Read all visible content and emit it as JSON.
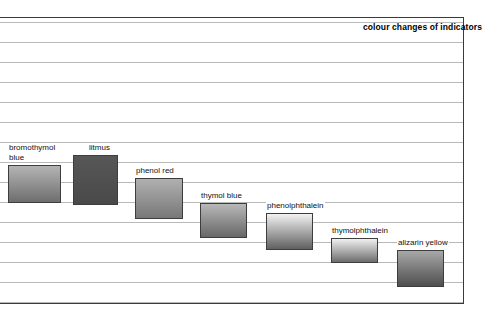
{
  "chart_data": {
    "type": "bar",
    "title": "colour changes of indicators",
    "xlabel": "",
    "ylabel": "",
    "orientation": "vertical-ranges",
    "grid": true,
    "legend_position": "none",
    "note": "Each indicator is drawn as a shaded vertical band spanning its colour-change pH range; bands step progressively downward and to the right.",
    "categories": [
      "bromothymol blue",
      "litmus",
      "phenol red",
      "thymol blue",
      "phenolphthalein",
      "thymolphthalein",
      "alizarin yellow"
    ],
    "bands": [
      {
        "name": "bromothymol blue",
        "label": "bromothymol\nblue",
        "x": 8,
        "y": 165,
        "width": 53,
        "height": 38,
        "label_x": 8,
        "label_y": 143,
        "gradient_top": "#b4b4b4",
        "gradient_bottom": "#6e6e6e"
      },
      {
        "name": "litmus",
        "label": "litmus",
        "x": 73,
        "y": 155,
        "width": 45,
        "height": 50,
        "label_x": 88,
        "label_y": 143,
        "gradient_top": "#575757",
        "gradient_bottom": "#494949"
      },
      {
        "name": "phenol red",
        "label": "phenol red",
        "x": 135,
        "y": 178,
        "width": 48,
        "height": 41,
        "label_x": 135,
        "label_y": 166,
        "gradient_top": "#b0b0b0",
        "gradient_bottom": "#787878"
      },
      {
        "name": "thymol blue",
        "label": "thymol blue",
        "x": 200,
        "y": 203,
        "width": 47,
        "height": 35,
        "label_x": 200,
        "label_y": 191,
        "gradient_top": "#b8b8b8",
        "gradient_bottom": "#676767"
      },
      {
        "name": "phenolphthalein",
        "label": "phenolphthalein",
        "x": 266,
        "y": 213,
        "width": 47,
        "height": 37,
        "label_x": 266,
        "label_y": 201,
        "gradient_top": "#f2f2f2",
        "gradient_bottom": "#606060"
      },
      {
        "name": "thymolphthalein",
        "label": "thymolphthalein",
        "x": 331,
        "y": 238,
        "width": 47,
        "height": 25,
        "label_x": 331,
        "label_y": 226,
        "gradient_top": "#f0f0f0",
        "gradient_bottom": "#6d6d6d"
      },
      {
        "name": "alizarin yellow",
        "label": "alizarin yellow",
        "x": 397,
        "y": 250,
        "width": 47,
        "height": 37,
        "label_x": 397,
        "label_y": 238,
        "gradient_top": "#a8a8a8",
        "gradient_bottom": "#4e4e4e"
      }
    ],
    "gridlines_y": [
      22,
      42,
      62,
      82,
      102,
      122,
      142,
      162,
      182,
      202,
      222,
      242,
      262,
      282,
      302
    ],
    "frame": {
      "top": 17,
      "right": 463,
      "bottom": 303,
      "left": 0
    },
    "colors": {
      "gridline": "#b9b9b9",
      "frame": "#3a3a3a",
      "background": "#ffffff",
      "text": "#111111"
    }
  }
}
